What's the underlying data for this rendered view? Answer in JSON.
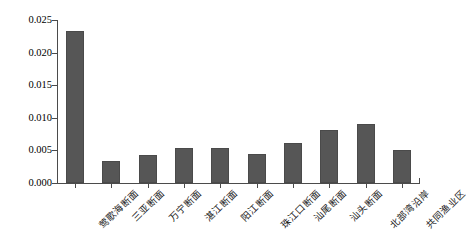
{
  "chart_data": {
    "type": "bar",
    "title": "",
    "xlabel": "",
    "ylabel": "",
    "ylim": [
      0,
      0.025
    ],
    "grid": false,
    "legend": "none",
    "bar_color": "#565656",
    "axis_color": "#4b4b4b",
    "categories": [
      "莺歌海断面",
      "三亚断面",
      "万宁断面",
      "湛江断面",
      "阳江断面",
      "珠江口断面",
      "汕尾断面",
      "汕头断面",
      "北部湾沿岸",
      "共同渔业区"
    ],
    "values": [
      0.0233,
      0.0034,
      0.0043,
      0.0054,
      0.0053,
      0.0045,
      0.0062,
      0.0082,
      0.009,
      0.005
    ],
    "ytick_labels": [
      "0.000",
      "0.005",
      "0.010",
      "0.015",
      "0.020",
      "0.025"
    ],
    "ytick_values": [
      0.0,
      0.005,
      0.01,
      0.015,
      0.02,
      0.025
    ]
  }
}
